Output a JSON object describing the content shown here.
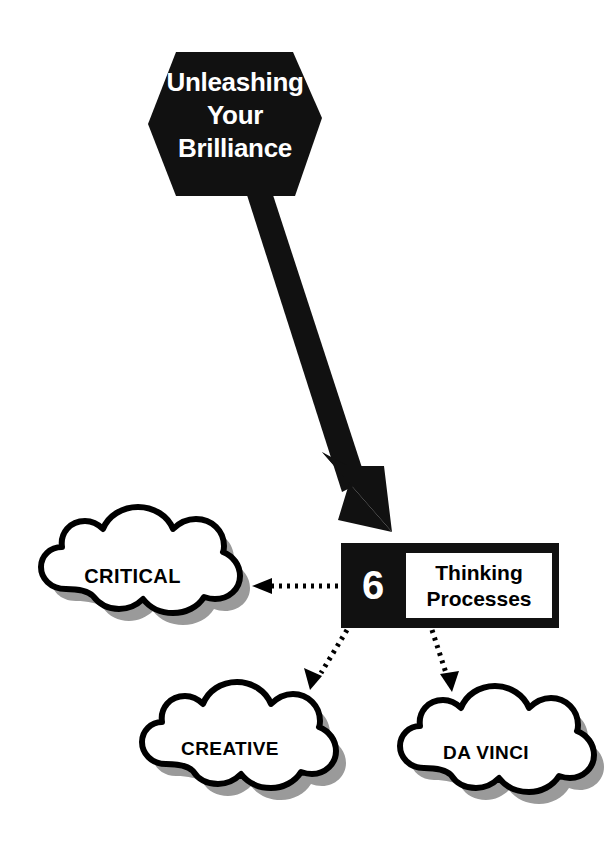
{
  "title_shape": {
    "icon": "hexagon-banner",
    "lines": [
      "Unleashing",
      "Your",
      "Brilliance"
    ],
    "fill": "#111111",
    "text_color": "#ffffff"
  },
  "main_arrow": {
    "icon": "thick-down-right-arrow",
    "fill": "#111111"
  },
  "process_box": {
    "count": "6",
    "label_lines": [
      "Thinking",
      "Processes"
    ],
    "box_fill": "#111111",
    "inner_fill": "#ffffff",
    "count_color": "#ffffff",
    "label_color": "#000000"
  },
  "clouds": [
    {
      "id": "critical",
      "label": "CRITICAL",
      "icon": "cloud-shape",
      "fill": "#ffffff",
      "stroke": "#000000",
      "shadow": "#9a9a9a"
    },
    {
      "id": "creative",
      "label": "CREATIVE",
      "icon": "cloud-shape",
      "fill": "#ffffff",
      "stroke": "#000000",
      "shadow": "#9a9a9a"
    },
    {
      "id": "davinci",
      "label": "DA VINCI",
      "icon": "cloud-shape",
      "fill": "#ffffff",
      "stroke": "#000000",
      "shadow": "#9a9a9a"
    }
  ],
  "connectors": [
    {
      "id": "to-critical",
      "icon": "dotted-arrow-left",
      "color": "#000000"
    },
    {
      "id": "to-creative",
      "icon": "dotted-arrow-down-left",
      "color": "#000000"
    },
    {
      "id": "to-davinci",
      "icon": "dotted-arrow-down-right",
      "color": "#000000"
    }
  ]
}
